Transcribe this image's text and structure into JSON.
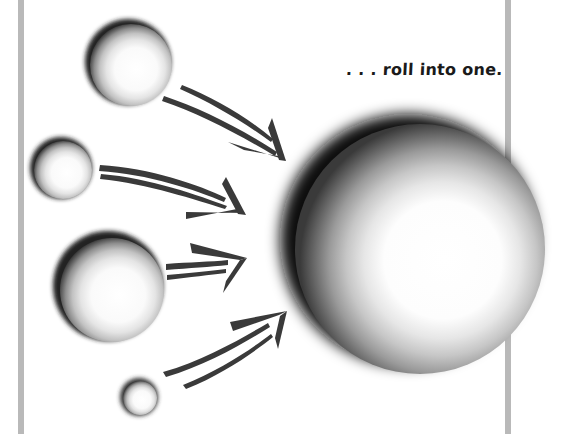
{
  "caption": {
    "text": ". . . roll into one."
  },
  "colors": {
    "background": "#ffffff",
    "frame_bar": "#b9b9b9",
    "arrow": "#3a3a3a",
    "sphere_dark": "#1e1e1e",
    "sphere_light": "#ffffff",
    "text": "#1a1a1a"
  },
  "spheres": [
    {
      "name": "small-sphere-1",
      "cx": 130,
      "cy": 64,
      "r": 43
    },
    {
      "name": "small-sphere-2",
      "cx": 62,
      "cy": 169,
      "r": 31
    },
    {
      "name": "small-sphere-3",
      "cx": 110,
      "cy": 288,
      "r": 55
    },
    {
      "name": "small-sphere-4",
      "cx": 139,
      "cy": 397,
      "r": 19
    },
    {
      "name": "big-sphere",
      "cx": 418,
      "cy": 247,
      "r": 128
    }
  ],
  "arrows": [
    {
      "name": "arrow-1",
      "from": "small-sphere-1",
      "to": "big-sphere"
    },
    {
      "name": "arrow-2",
      "from": "small-sphere-2",
      "to": "big-sphere"
    },
    {
      "name": "arrow-3",
      "from": "small-sphere-3",
      "to": "big-sphere"
    },
    {
      "name": "arrow-4",
      "from": "small-sphere-4",
      "to": "big-sphere"
    }
  ]
}
